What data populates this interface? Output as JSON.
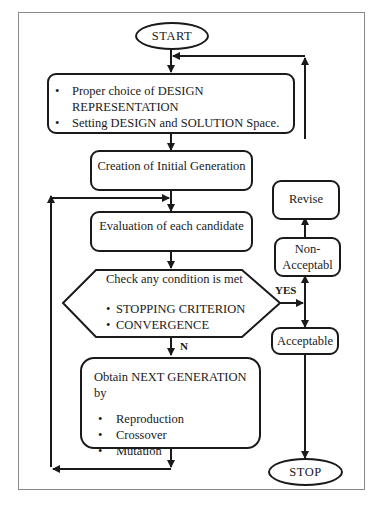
{
  "diagram": {
    "type": "flowchart",
    "start": "START",
    "stop": "STOP",
    "steps": {
      "setup": {
        "bullets": [
          "Proper choice of DESIGN REPRESENTATION",
          "Setting DESIGN and SOLUTION Space."
        ],
        "line1": "Proper choice of DESIGN",
        "line1b": "REPRESENTATION",
        "line2": "Setting DESIGN and SOLUTION Space."
      },
      "init": "Creation of Initial Generation",
      "evaluate": "Evaluation of each candidate",
      "check": {
        "title": "Check any condition is met",
        "conditions": [
          "STOPPING CRITERION",
          "CONVERGENCE"
        ]
      },
      "next": {
        "title": "Obtain NEXT GENERATION by",
        "operators": [
          "Reproduction",
          "Crossover",
          "Mutation"
        ]
      },
      "revise": "Revise",
      "non_acceptable_1": "Non-",
      "non_acceptable_2": "Acceptabl",
      "acceptable": "Acceptable"
    },
    "edge_labels": {
      "yes": "YES",
      "no": "N"
    }
  }
}
